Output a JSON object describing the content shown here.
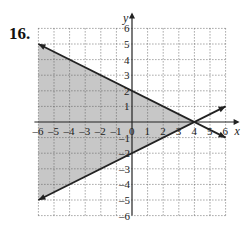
{
  "problem": {
    "number": "16."
  },
  "chart_data": {
    "type": "line",
    "title": "",
    "xlabel": "x",
    "ylabel": "y",
    "xlim": [
      -6,
      6
    ],
    "ylim": [
      -6,
      6
    ],
    "grid": true,
    "grid_style": "dotted",
    "x_ticks": [
      "-6",
      "-5",
      "-4",
      "-3",
      "-2",
      "-1",
      "0",
      "1",
      "2",
      "3",
      "4",
      "5",
      "6"
    ],
    "y_ticks": [
      "-6",
      "-5",
      "-4",
      "-3",
      "-2",
      "-1",
      "1",
      "2",
      "3",
      "4",
      "5",
      "6"
    ],
    "series": [
      {
        "name": "y = -1/2 x + 2",
        "x": [
          -6,
          6
        ],
        "y": [
          5,
          -1
        ],
        "style": "solid",
        "arrows": true
      },
      {
        "name": "y = 1/2 x - 2",
        "x": [
          -6,
          6
        ],
        "y": [
          -5,
          1
        ],
        "style": "solid",
        "arrows": true
      }
    ],
    "shaded_region": {
      "description": "region between the two lines, x <= 4",
      "vertices": [
        [
          -6,
          5
        ],
        [
          4,
          0
        ],
        [
          -6,
          -5
        ]
      ],
      "color": "#bdbdbd"
    },
    "intersection": [
      4,
      0
    ]
  }
}
